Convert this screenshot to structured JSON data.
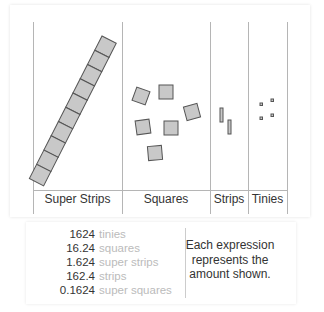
{
  "columns": [
    {
      "name": "Super Strips",
      "x_left": 33,
      "x_right": 122
    },
    {
      "name": "Squares",
      "x_left": 122,
      "x_right": 210
    },
    {
      "name": "Strips",
      "x_left": 210,
      "x_right": 248
    },
    {
      "name": "Tinies",
      "x_left": 248,
      "x_right": 287
    }
  ],
  "labels": {
    "super_strips": "Super Strips",
    "squares": "Squares",
    "strips": "Strips",
    "tinies": "Tinies"
  },
  "counts": {
    "super_strips": 1,
    "squares": 6,
    "strips": 2,
    "tinies": 4
  },
  "expressions": [
    {
      "value": "1624",
      "unit": "tinies"
    },
    {
      "value": "16.24",
      "unit": "squares"
    },
    {
      "value": "1.624",
      "unit": "super strips"
    },
    {
      "value": "162.4",
      "unit": "strips"
    },
    {
      "value": "0.1624",
      "unit": "super squares"
    }
  ],
  "note": "Each expression represents the amount shown.",
  "colors": {
    "block_fill": "#c8c8c8",
    "block_stroke": "#555555",
    "line": "#b5b5b5",
    "unit_text": "#bbbbbb"
  }
}
